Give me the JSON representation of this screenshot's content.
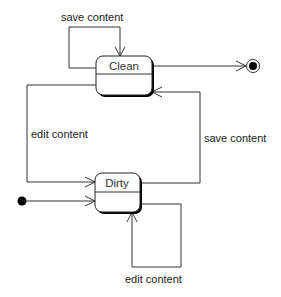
{
  "diagram": {
    "type": "uml-state-machine",
    "states": [
      {
        "id": "clean",
        "name": "Clean"
      },
      {
        "id": "dirty",
        "name": "Dirty"
      }
    ],
    "initial_state": "dirty",
    "final_from": "clean",
    "transitions": [
      {
        "from": "clean",
        "to": "clean",
        "label": "save content"
      },
      {
        "from": "clean",
        "to": "dirty",
        "label": "edit content"
      },
      {
        "from": "dirty",
        "to": "clean",
        "label": "save content"
      },
      {
        "from": "dirty",
        "to": "dirty",
        "label": "edit content"
      },
      {
        "from": "initial",
        "to": "dirty",
        "label": ""
      },
      {
        "from": "clean",
        "to": "final",
        "label": ""
      }
    ]
  },
  "colors": {
    "line": "#333333",
    "box_border": "#222222",
    "shadow": "#000000",
    "background": "#ffffff"
  }
}
